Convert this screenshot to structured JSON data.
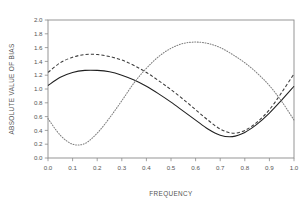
{
  "chart_data": {
    "type": "line",
    "title": "",
    "xlabel": "FREQUENCY",
    "ylabel": "ABSOLUTE VALUE OF BIAS",
    "xlim": [
      0.0,
      1.0
    ],
    "ylim": [
      0.0,
      2.0
    ],
    "grid": false,
    "legend": "none",
    "xticks": [
      "0.0",
      "0.1",
      "0.2",
      "0.3",
      "0.4",
      "0.5",
      "0.6",
      "0.7",
      "0.8",
      "0.9",
      "1.0"
    ],
    "xtick_values": [
      0.0,
      0.1,
      0.2,
      0.3,
      0.4,
      0.5,
      0.6,
      0.7,
      0.8,
      0.9,
      1.0
    ],
    "yticks": [
      "0.0",
      "0.2",
      "0.4",
      "0.6",
      "0.8",
      "1.0",
      "1.2",
      "1.4",
      "1.6",
      "1.8",
      "2.0"
    ],
    "ytick_values": [
      0.0,
      0.2,
      0.4,
      0.6,
      0.8,
      1.0,
      1.2,
      1.4,
      1.6,
      1.8,
      2.0
    ],
    "x": [
      0.0,
      0.05,
      0.1,
      0.15,
      0.2,
      0.25,
      0.3,
      0.35,
      0.4,
      0.45,
      0.5,
      0.55,
      0.6,
      0.65,
      0.7,
      0.75,
      0.8,
      0.85,
      0.9,
      0.95,
      1.0
    ],
    "series": [
      {
        "name": "solid",
        "style": "solid",
        "color": "#1f1f1f",
        "values": [
          1.05,
          1.17,
          1.24,
          1.27,
          1.27,
          1.25,
          1.2,
          1.13,
          1.04,
          0.93,
          0.81,
          0.68,
          0.55,
          0.42,
          0.33,
          0.31,
          0.37,
          0.49,
          0.65,
          0.84,
          1.04
        ]
      },
      {
        "name": "dashed",
        "style": "dashed",
        "color": "#3a3a3a",
        "values": [
          1.24,
          1.38,
          1.46,
          1.5,
          1.5,
          1.47,
          1.42,
          1.34,
          1.24,
          1.12,
          0.99,
          0.85,
          0.7,
          0.55,
          0.42,
          0.36,
          0.4,
          0.52,
          0.7,
          0.95,
          1.22
        ]
      },
      {
        "name": "dotted",
        "style": "dotted",
        "color": "#808080",
        "values": [
          0.57,
          0.33,
          0.2,
          0.21,
          0.36,
          0.58,
          0.83,
          1.09,
          1.3,
          1.47,
          1.59,
          1.66,
          1.68,
          1.66,
          1.6,
          1.5,
          1.38,
          1.23,
          1.05,
          0.82,
          0.55
        ]
      }
    ]
  },
  "plot_geometry": {
    "left": 48,
    "right": 294,
    "top": 20,
    "bottom": 158
  }
}
